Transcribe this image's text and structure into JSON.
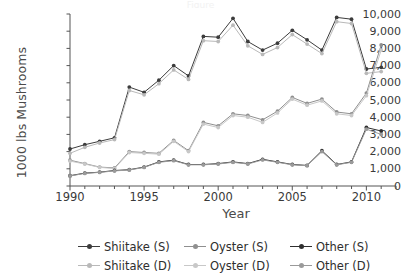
{
  "title_cropped": "Figure",
  "chart_data": {
    "type": "line",
    "title": "",
    "xlabel": "Year",
    "ylabel": "1000 lbs Mushrooms",
    "xlim": [
      1990,
      2012
    ],
    "ylim": [
      0,
      10000
    ],
    "xticks": [
      1990,
      1995,
      2000,
      2005,
      2010
    ],
    "xtick_labels": [
      "1990",
      "1995",
      "2000",
      "2005",
      "2010"
    ],
    "xminor_step": 1,
    "yticks": [
      0,
      1000,
      2000,
      3000,
      4000,
      5000,
      6000,
      7000,
      8000,
      9000,
      10000
    ],
    "ytick_labels": [
      "0",
      "1,000",
      "2,000",
      "3,000",
      "4,000",
      "5,000",
      "6,000",
      "7,000",
      "8,000",
      "9,000",
      "10,000"
    ],
    "grid": false,
    "legend_position": "bottom",
    "legend_columns": 3,
    "x": [
      1990,
      1991,
      1992,
      1993,
      1994,
      1995,
      1996,
      1997,
      1998,
      1999,
      2000,
      2001,
      2002,
      2003,
      2004,
      2005,
      2006,
      2007,
      2008,
      2009,
      2010,
      2011
    ],
    "series": [
      {
        "name": "Shiitake (S)",
        "color": "#3c3c3c",
        "marker": "circle",
        "values": [
          2150,
          2400,
          2600,
          2800,
          5750,
          5450,
          6150,
          7000,
          6400,
          8700,
          8650,
          9750,
          8400,
          7900,
          8300,
          9050,
          8500,
          7900,
          9800,
          9700,
          6800,
          6900
        ]
      },
      {
        "name": "Shiitake (D)",
        "color": "#b9b9b9",
        "marker": "circle",
        "values": [
          1900,
          2250,
          2500,
          2700,
          5550,
          5300,
          5950,
          6750,
          6200,
          8450,
          8400,
          9350,
          8150,
          7650,
          8050,
          8800,
          8250,
          7700,
          9550,
          9450,
          6550,
          6650
        ]
      },
      {
        "name": "Oyster (S)",
        "color": "#8f8f8f",
        "marker": "circle",
        "values": [
          1500,
          1300,
          1100,
          1050,
          2000,
          1950,
          1900,
          2650,
          2050,
          3700,
          3500,
          4200,
          4100,
          3850,
          4350,
          5150,
          4800,
          5050,
          4300,
          4200,
          5400,
          8200
        ]
      },
      {
        "name": "Oyster (D)",
        "color": "#c8c8c8",
        "marker": "circle",
        "values": [
          1450,
          1280,
          1080,
          1020,
          1950,
          1900,
          1850,
          2600,
          2000,
          3600,
          3400,
          4100,
          4000,
          3700,
          4250,
          5050,
          4700,
          4950,
          4200,
          4100,
          5250,
          7900
        ]
      },
      {
        "name": "Other (S)",
        "color": "#2f2f2f",
        "marker": "circle",
        "values": [
          600,
          750,
          800,
          900,
          950,
          1100,
          1400,
          1500,
          1250,
          1250,
          1300,
          1400,
          1300,
          1550,
          1400,
          1250,
          1200,
          2050,
          1250,
          1400,
          3400,
          3200
        ]
      },
      {
        "name": "Other (D)",
        "color": "#9a9a9a",
        "marker": "circle",
        "values": [
          580,
          730,
          790,
          880,
          930,
          1080,
          1380,
          1470,
          1230,
          1230,
          1280,
          1380,
          1280,
          1520,
          1380,
          1230,
          1180,
          2000,
          1230,
          1380,
          3300,
          3000
        ]
      }
    ]
  }
}
